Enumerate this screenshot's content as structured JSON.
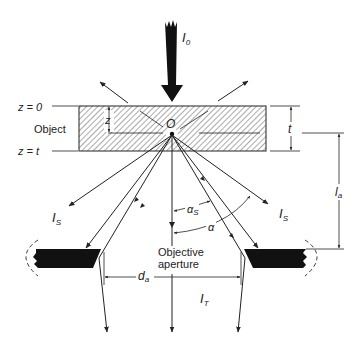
{
  "diagram": {
    "type": "optical schematic",
    "colors": {
      "line": "#222222",
      "fill_dark": "#111111",
      "hatch": "#555555",
      "background": "#ffffff"
    }
  },
  "labels": {
    "incident_beam": {
      "main": "I",
      "sub": "0"
    },
    "z_zero": "z = 0",
    "z_t": "z = t",
    "object": "Object",
    "depth_z": "z",
    "origin": "O",
    "thickness": "t",
    "scattered_left": {
      "main": "I",
      "sub": "S"
    },
    "scattered_right": {
      "main": "I",
      "sub": "S"
    },
    "alpha_s": {
      "main": "α",
      "sub": "S"
    },
    "alpha": "α",
    "aperture_line1": "Objective",
    "aperture_line2": "aperture",
    "aperture_distance": {
      "main": "l",
      "sub": "a"
    },
    "aperture_diameter": {
      "main": "d",
      "sub": "a"
    },
    "transmitted": {
      "main": "I",
      "sub": "T"
    }
  }
}
